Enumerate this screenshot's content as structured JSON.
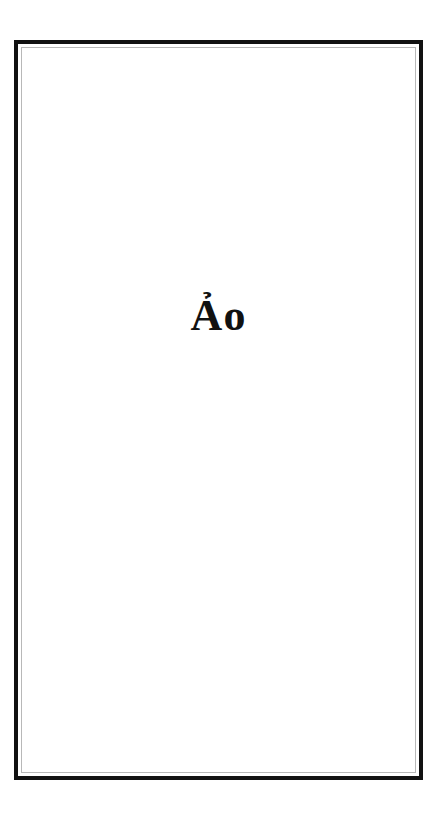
{
  "card": {
    "word": "Ảo",
    "colors": {
      "outer_border": "#111111",
      "inner_border": "#b8b8b8",
      "background": "#ffffff",
      "text": "#111111"
    }
  }
}
